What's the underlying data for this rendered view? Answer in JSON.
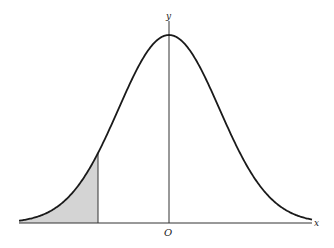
{
  "diagram": {
    "labels": {
      "y_axis": "y",
      "x_axis": "x",
      "origin": "O"
    },
    "curve": {
      "type": "normal-density",
      "peak_at": "O",
      "shaded_region": "left tail up to a vertical line left of O"
    },
    "colors": {
      "line": "#1a1a1a",
      "shade": "#d4d4d4",
      "background": "#ffffff"
    }
  }
}
